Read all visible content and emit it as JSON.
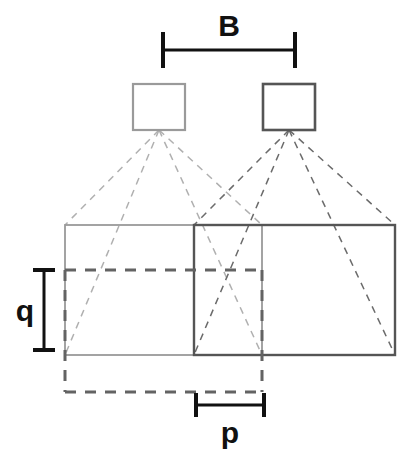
{
  "figure": {
    "type": "stereo-camera-geometry-diagram",
    "background_color": "#ffffff",
    "width": 418,
    "height": 467
  },
  "labels": {
    "baseline": "B",
    "depth": "q",
    "disparity": "p"
  },
  "colors": {
    "dark_stroke": "#555555",
    "light_stroke": "#9a9a9a",
    "dashed_ray_dark": "#6b6b6b",
    "dashed_ray_light": "#b0b0b0",
    "dimension_black": "#111111",
    "offset_dashed": "#636363"
  },
  "cameras": [
    {
      "name": "left-camera",
      "x": 133,
      "y": 84,
      "width": 52,
      "height": 46,
      "stroke": "#9a9a9a",
      "stroke_width": 2.2,
      "apex_x": 159,
      "apex_y": 130
    },
    {
      "name": "right-camera",
      "x": 263,
      "y": 84,
      "width": 52,
      "height": 46,
      "stroke": "#555555",
      "stroke_width": 2.6,
      "apex_x": 289,
      "apex_y": 130
    }
  ],
  "footprints": [
    {
      "name": "left-image-plane",
      "x": 65,
      "y": 225,
      "width": 197,
      "height": 130,
      "stroke": "#9a9a9a",
      "stroke_width": 1.8
    },
    {
      "name": "right-image-plane",
      "x": 194,
      "y": 225,
      "width": 201,
      "height": 130,
      "stroke": "#555555",
      "stroke_width": 2.4
    }
  ],
  "offset_rectangle": {
    "name": "shifted-footprint",
    "x": 65,
    "y": 270,
    "width": 197,
    "height": 122,
    "stroke": "#636363",
    "stroke_width": 3,
    "dash": "11,9"
  },
  "rays": {
    "left_camera_targets": [
      {
        "x": 65,
        "y": 225
      },
      {
        "x": 65,
        "y": 355
      },
      {
        "x": 262,
        "y": 225
      },
      {
        "x": 262,
        "y": 355
      }
    ],
    "right_camera_targets": [
      {
        "x": 194,
        "y": 225
      },
      {
        "x": 194,
        "y": 355
      },
      {
        "x": 395,
        "y": 225
      },
      {
        "x": 395,
        "y": 355
      }
    ],
    "dash": "7,6",
    "stroke_width": 1.5
  },
  "dimensions": {
    "baseline_bar": {
      "name": "baseline-dimension",
      "label": "B",
      "x1": 163,
      "x2": 295,
      "y": 50,
      "tick_half": 18,
      "label_x": 229,
      "label_y": 36,
      "font_size": 30
    },
    "depth_bar": {
      "name": "depth-dimension",
      "label": "q",
      "x": 44,
      "y1": 270,
      "y2": 350,
      "tick_half": 11,
      "label_x": 25,
      "label_y": 321,
      "font_size": 30
    },
    "disparity_bar": {
      "name": "disparity-dimension",
      "label": "p",
      "x1": 196,
      "x2": 264,
      "y": 405,
      "tick_half": 12,
      "label_x": 230,
      "label_y": 443,
      "font_size": 30
    }
  },
  "inner_dashed_line": {
    "name": "depth-reference-line",
    "x1": 65,
    "x2": 262,
    "y": 270
  }
}
